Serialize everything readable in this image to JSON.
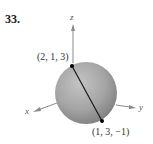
{
  "problem": {
    "number": "33."
  },
  "axes": {
    "x": "x",
    "y": "y",
    "z": "z"
  },
  "points": [
    {
      "label": "(2, 1, 3)"
    },
    {
      "label": "(1, 3, −1)"
    }
  ],
  "colors": {
    "sphere_light": "#c8c8c8",
    "sphere_dark": "#7a7a7a",
    "axis": "#888888",
    "segment": "#1a1a1a"
  }
}
